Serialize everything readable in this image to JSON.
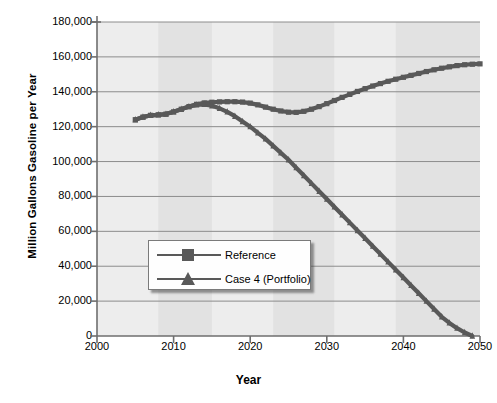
{
  "chart_data": {
    "type": "line",
    "title": "",
    "xlabel": "Year",
    "ylabel": "Million Gallons Gasoline per Year",
    "xlim": [
      2000,
      2050
    ],
    "ylim": [
      0,
      180000
    ],
    "xticks": [
      2000,
      2010,
      2020,
      2030,
      2040,
      2050
    ],
    "xtick_labels": [
      "2000",
      "2010",
      "2020",
      "2030",
      "2040",
      "2050"
    ],
    "yticks": [
      0,
      20000,
      40000,
      60000,
      80000,
      100000,
      120000,
      140000,
      160000,
      180000
    ],
    "ytick_labels": [
      "0",
      "20,000",
      "40,000",
      "60,000",
      "80,000",
      "100,000",
      "120,000",
      "140,000",
      "160,000",
      "180,000"
    ],
    "grid": "horizontal",
    "legend_position": "center-left",
    "series": [
      {
        "name": "Reference",
        "marker": "square",
        "color": "#595959",
        "x": [
          2005,
          2006,
          2007,
          2008,
          2009,
          2010,
          2011,
          2012,
          2013,
          2014,
          2015,
          2016,
          2017,
          2018,
          2019,
          2020,
          2021,
          2022,
          2023,
          2024,
          2025,
          2026,
          2027,
          2028,
          2029,
          2030,
          2031,
          2032,
          2033,
          2034,
          2035,
          2036,
          2037,
          2038,
          2039,
          2040,
          2041,
          2042,
          2043,
          2044,
          2045,
          2046,
          2047,
          2048,
          2049,
          2050
        ],
        "values": [
          124000,
          125500,
          126500,
          126800,
          127200,
          128500,
          130000,
          131500,
          132800,
          133600,
          134000,
          134200,
          134300,
          134300,
          134100,
          133500,
          132500,
          131200,
          130000,
          129000,
          128300,
          128200,
          128800,
          130000,
          131500,
          133200,
          135000,
          136800,
          138500,
          140200,
          141800,
          143300,
          144700,
          146000,
          147200,
          148300,
          149400,
          150500,
          151600,
          152600,
          153500,
          154300,
          155000,
          155500,
          155800,
          156000
        ]
      },
      {
        "name": "Case 4 (Portfolio)",
        "marker": "triangle",
        "color": "#595959",
        "x": [
          2005,
          2006,
          2007,
          2008,
          2009,
          2010,
          2011,
          2012,
          2013,
          2014,
          2015,
          2016,
          2017,
          2018,
          2019,
          2020,
          2021,
          2022,
          2023,
          2024,
          2025,
          2026,
          2027,
          2028,
          2029,
          2030,
          2031,
          2032,
          2033,
          2034,
          2035,
          2036,
          2037,
          2038,
          2039,
          2040,
          2041,
          2042,
          2043,
          2044,
          2045,
          2046,
          2047,
          2048,
          2049
        ],
        "values": [
          124000,
          125500,
          126500,
          126800,
          127200,
          128500,
          130000,
          131500,
          132500,
          132800,
          132000,
          130500,
          128500,
          126000,
          123000,
          120000,
          116500,
          113000,
          109000,
          105000,
          101000,
          96500,
          92000,
          87500,
          83000,
          78500,
          74000,
          69500,
          65000,
          60500,
          56000,
          51500,
          47000,
          42500,
          38000,
          33500,
          29000,
          24500,
          20000,
          15500,
          11000,
          7500,
          4500,
          2000,
          0
        ]
      }
    ]
  },
  "axes": {
    "ylabel": "Million Gallons Gasoline per Year",
    "xlabel": "Year"
  },
  "legend": {
    "items": [
      {
        "label": "Reference",
        "marker": "square-marker-icon"
      },
      {
        "label": "Case 4 (Portfolio)",
        "marker": "triangle-marker-icon"
      }
    ]
  },
  "colors": {
    "series": "#595959",
    "plot_background": "#ececec",
    "band_light": "#ededed",
    "band_dark": "#e2e2e2",
    "gridline": "#8c8c8c",
    "axis": "#6e6e6e"
  }
}
